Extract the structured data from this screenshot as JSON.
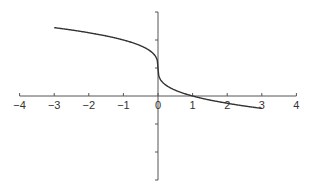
{
  "chart_data": {
    "type": "line",
    "title": "",
    "xlabel": "",
    "ylabel": "",
    "xlim": [
      -4,
      4
    ],
    "ylim": [
      -3,
      3
    ],
    "grid": false,
    "legend": null,
    "x_ticks": [
      -4,
      -3,
      -2,
      -1,
      0,
      1,
      2,
      3,
      4
    ],
    "x_tick_labels": [
      "−4",
      "−3",
      "−2",
      "−1",
      "0",
      "1",
      "2",
      "3",
      "4"
    ],
    "y_ticks": [
      -3,
      -2,
      -1,
      1,
      2,
      3
    ],
    "y_tick_labels": [],
    "series": [
      {
        "name": "y = 1 - x^(1/3)",
        "x": [
          -3,
          -2.5,
          -2,
          -1.5,
          -1,
          -0.5,
          -0.2,
          -0.05,
          0,
          0.05,
          0.2,
          0.5,
          1,
          1.5,
          2,
          2.5,
          3
        ],
        "y": [
          2.44,
          2.36,
          2.26,
          2.14,
          2.0,
          1.79,
          1.58,
          1.37,
          1.0,
          0.63,
          0.42,
          0.21,
          0.0,
          -0.14,
          -0.26,
          -0.36,
          -0.44
        ]
      }
    ],
    "annotations": [
      "vertical tangent at (0, 1)",
      "x-intercept at (1, 0)"
    ]
  },
  "colors": {
    "curve": "#333333",
    "axes": "#555555",
    "background": "#ffffff"
  }
}
